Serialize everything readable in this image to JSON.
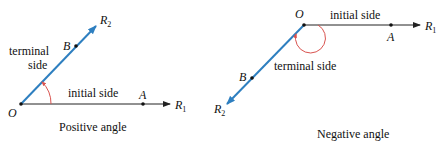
{
  "colors": {
    "terminal_ray": "#2e7fc0",
    "initial_ray": "#222222",
    "angle_arc": "#d9534f",
    "points": "#111111"
  },
  "positive": {
    "caption": "Positive angle",
    "vertex_label": "O",
    "point_a_label": "A",
    "point_b_label": "B",
    "r1_label": "R",
    "r1_sub": "1",
    "r2_label": "R",
    "r2_sub": "2",
    "initial_side_label": "initial side",
    "terminal_side_label_line1": "terminal",
    "terminal_side_label_line2": "side"
  },
  "negative": {
    "caption": "Negative angle",
    "vertex_label": "O",
    "point_a_label": "A",
    "point_b_label": "B",
    "r1_label": "R",
    "r1_sub": "1",
    "r2_label": "R",
    "r2_sub": "2",
    "initial_side_label": "initial side",
    "terminal_side_label": "terminal side"
  }
}
